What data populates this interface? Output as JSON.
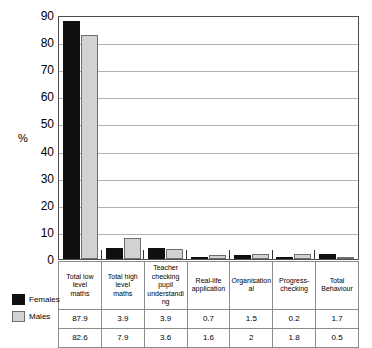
{
  "chart_data": {
    "type": "bar",
    "title": "",
    "xlabel": "",
    "ylabel": "%",
    "ylim": [
      0,
      90
    ],
    "ytick_step": 10,
    "yticks": [
      90,
      80,
      70,
      60,
      50,
      40,
      30,
      20,
      10,
      0
    ],
    "grid": true,
    "legend_position": "bottom-left",
    "categories": [
      "Total low level maths",
      "Total high level maths",
      "Teacher checking pupil understanding",
      "Real-life application",
      "Organisational",
      "Progress-checking",
      "Total Behaviour"
    ],
    "category_lines": [
      [
        "Total low",
        "level",
        "maths"
      ],
      [
        "Total high",
        "level",
        "maths"
      ],
      [
        "Teacher",
        "checking pupil",
        "understanding"
      ],
      [
        "Real-life",
        "application"
      ],
      [
        "Organisational"
      ],
      [
        "Progress-",
        "checking"
      ],
      [
        "Total",
        "Behaviour"
      ]
    ],
    "series": [
      {
        "name": "Females",
        "color": "#101010",
        "values": [
          87.9,
          3.9,
          3.9,
          0.7,
          1.5,
          0.2,
          1.7
        ],
        "labels": [
          "87.9",
          "3.9",
          "3.9",
          "0.7",
          "1.5",
          "0.2",
          "1.7"
        ]
      },
      {
        "name": "Males",
        "color": "#d2d2d2",
        "values": [
          82.6,
          7.9,
          3.6,
          1.6,
          2,
          1.8,
          0.5
        ],
        "labels": [
          "82.6",
          "7.9",
          "3.6",
          "1.6",
          "2",
          "1.8",
          "0.5"
        ]
      }
    ]
  }
}
